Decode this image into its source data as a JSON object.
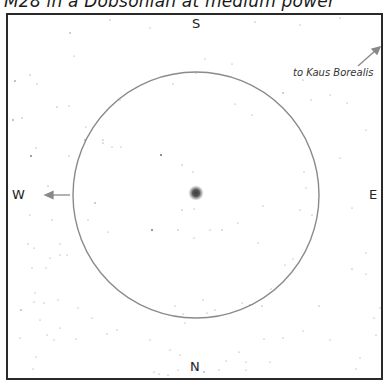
{
  "title": "M28 in a Dobsonian at medium power",
  "directions": {
    "top": "S",
    "bottom": "N",
    "left": "W",
    "right": "E"
  },
  "annotation": {
    "label": "to Kaus Borealis",
    "arrow": "arrow-up-right-icon"
  },
  "field_of_view": {
    "shape": "circle",
    "center": [
      196,
      195
    ],
    "radius": 123,
    "stroke": "#8a8a8a"
  },
  "object": {
    "name": "M28",
    "type": "globular-cluster",
    "position": [
      196,
      193
    ]
  },
  "west_arrow": {
    "icon": "arrow-left-icon"
  },
  "colors": {
    "frame": "#2a2a2a",
    "circle": "#8a8a8a",
    "stars": "#555555",
    "background": "#ffffff"
  }
}
